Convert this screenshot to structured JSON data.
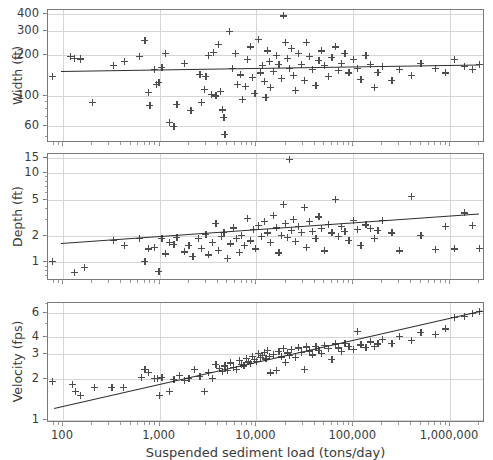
{
  "figure": {
    "xlabel": "Suspended sediment load (tons/day)",
    "background": "#ffffff",
    "marker_color": "#4d4d4d",
    "line_color": "#2e2e2e",
    "grid_color": "#d6d6d6"
  },
  "chart_data": [
    {
      "type": "scatter",
      "title": "",
      "panel": "width",
      "xlabel": "Suspended sediment load (tons/day)",
      "ylabel": "Width (ft)",
      "xscale": "log",
      "yscale": "log",
      "xlim": [
        70,
        2300000
      ],
      "ylim": [
        45,
        430
      ],
      "xticks": [
        100,
        1000,
        10000,
        100000,
        1000000
      ],
      "xtick_labels": [
        "100",
        "1,000",
        "10,000",
        "100,000",
        "1,000,000"
      ],
      "yticks": [
        60,
        100,
        200,
        300,
        400
      ],
      "ytick_labels": [
        "60",
        "100",
        "200",
        "300",
        "400"
      ],
      "grid": true,
      "legend": "none",
      "trendline": {
        "x": [
          95,
          2000000
        ],
        "y": [
          152,
          170
        ]
      },
      "points": [
        [
          78,
          140
        ],
        [
          120,
          196
        ],
        [
          132,
          190
        ],
        [
          150,
          187
        ],
        [
          152,
          188
        ],
        [
          200,
          90
        ],
        [
          330,
          167
        ],
        [
          430,
          181
        ],
        [
          620,
          195
        ],
        [
          700,
          258
        ],
        [
          760,
          106
        ],
        [
          790,
          85
        ],
        [
          880,
          156
        ],
        [
          920,
          121
        ],
        [
          980,
          126
        ],
        [
          1050,
          163
        ],
        [
          1150,
          207
        ],
        [
          1250,
          64
        ],
        [
          1400,
          60
        ],
        [
          1500,
          87
        ],
        [
          1800,
          175
        ],
        [
          2100,
          78
        ],
        [
          2600,
          145
        ],
        [
          2700,
          90
        ],
        [
          2900,
          112
        ],
        [
          3000,
          140
        ],
        [
          3200,
          199
        ],
        [
          3400,
          103
        ],
        [
          3600,
          211
        ],
        [
          3800,
          100
        ],
        [
          4000,
          240
        ],
        [
          4200,
          108
        ],
        [
          4400,
          79
        ],
        [
          4600,
          70
        ],
        [
          4700,
          52
        ],
        [
          5200,
          300
        ],
        [
          5600,
          160
        ],
        [
          6000,
          205
        ],
        [
          6400,
          122
        ],
        [
          6800,
          143
        ],
        [
          7200,
          95
        ],
        [
          7600,
          118
        ],
        [
          8000,
          186
        ],
        [
          8600,
          230
        ],
        [
          9000,
          137
        ],
        [
          9600,
          104
        ],
        [
          10500,
          260
        ],
        [
          11000,
          148
        ],
        [
          11500,
          167
        ],
        [
          12000,
          128
        ],
        [
          12500,
          98
        ],
        [
          13000,
          215
        ],
        [
          13500,
          180
        ],
        [
          14000,
          115
        ],
        [
          15000,
          152
        ],
        [
          16000,
          200
        ],
        [
          17000,
          170
        ],
        [
          18000,
          135
        ],
        [
          19000,
          390
        ],
        [
          20000,
          250
        ],
        [
          21000,
          190
        ],
        [
          22000,
          160
        ],
        [
          23000,
          225
        ],
        [
          24000,
          142
        ],
        [
          25000,
          110
        ],
        [
          27000,
          205
        ],
        [
          29000,
          172
        ],
        [
          31000,
          130
        ],
        [
          33000,
          248
        ],
        [
          35000,
          195
        ],
        [
          38000,
          158
        ],
        [
          41000,
          120
        ],
        [
          44000,
          182
        ],
        [
          47000,
          215
        ],
        [
          50000,
          168
        ],
        [
          55000,
          140
        ],
        [
          60000,
          192
        ],
        [
          65000,
          230
        ],
        [
          70000,
          155
        ],
        [
          75000,
          175
        ],
        [
          82000,
          205
        ],
        [
          90000,
          148
        ],
        [
          100000,
          185
        ],
        [
          110000,
          160
        ],
        [
          120000,
          132
        ],
        [
          135000,
          198
        ],
        [
          150000,
          172
        ],
        [
          165000,
          115
        ],
        [
          180000,
          150
        ],
        [
          200000,
          165
        ],
        [
          250000,
          130
        ],
        [
          300000,
          158
        ],
        [
          400000,
          142
        ],
        [
          500000,
          175
        ],
        [
          700000,
          160
        ],
        [
          900000,
          148
        ],
        [
          1100000,
          186
        ],
        [
          1400000,
          166
        ],
        [
          1700000,
          158
        ],
        [
          2000000,
          170
        ]
      ]
    },
    {
      "type": "scatter",
      "title": "",
      "panel": "depth",
      "xlabel": "Suspended sediment load (tons/day)",
      "ylabel": "Depth (ft)",
      "xscale": "log",
      "yscale": "log",
      "xlim": [
        70,
        2300000
      ],
      "ylim": [
        0.62,
        16.5
      ],
      "xticks": [
        100,
        1000,
        10000,
        100000,
        1000000
      ],
      "xtick_labels": [
        "100",
        "1,000",
        "10,000",
        "100,000",
        "1,000,000"
      ],
      "yticks": [
        1,
        2,
        5,
        10,
        15
      ],
      "ytick_labels": [
        "1",
        "2",
        "5",
        "10",
        "15"
      ],
      "grid": true,
      "legend": "none",
      "trendline": {
        "x": [
          95,
          2000000
        ],
        "y": [
          1.66,
          3.55
        ]
      },
      "points": [
        [
          78,
          1.02
        ],
        [
          130,
          0.78
        ],
        [
          165,
          0.88
        ],
        [
          330,
          1.78
        ],
        [
          430,
          1.55
        ],
        [
          620,
          1.86
        ],
        [
          700,
          1.02
        ],
        [
          760,
          1.42
        ],
        [
          880,
          1.48
        ],
        [
          980,
          0.79
        ],
        [
          1050,
          1.88
        ],
        [
          1150,
          1.25
        ],
        [
          1250,
          1.7
        ],
        [
          1400,
          1.6
        ],
        [
          1500,
          1.92
        ],
        [
          1800,
          1.32
        ],
        [
          2000,
          1.55
        ],
        [
          2200,
          1.18
        ],
        [
          2500,
          1.85
        ],
        [
          2700,
          1.45
        ],
        [
          3000,
          2.08
        ],
        [
          3200,
          1.22
        ],
        [
          3500,
          1.7
        ],
        [
          3800,
          2.75
        ],
        [
          4000,
          1.38
        ],
        [
          4300,
          1.95
        ],
        [
          4600,
          2.2
        ],
        [
          5000,
          1.12
        ],
        [
          5400,
          1.62
        ],
        [
          5800,
          2.45
        ],
        [
          6200,
          1.88
        ],
        [
          6600,
          1.3
        ],
        [
          7000,
          2.02
        ],
        [
          7500,
          1.55
        ],
        [
          8000,
          3.1
        ],
        [
          8600,
          1.75
        ],
        [
          9200,
          2.35
        ],
        [
          9800,
          1.42
        ],
        [
          10500,
          2.6
        ],
        [
          11200,
          1.95
        ],
        [
          12000,
          2.88
        ],
        [
          13000,
          2.15
        ],
        [
          14000,
          1.68
        ],
        [
          15000,
          3.4
        ],
        [
          16000,
          2.45
        ],
        [
          17000,
          1.28
        ],
        [
          18000,
          2.02
        ],
        [
          19000,
          4.5
        ],
        [
          20000,
          2.75
        ],
        [
          21000,
          1.92
        ],
        [
          22000,
          14.5
        ],
        [
          23000,
          2.3
        ],
        [
          24000,
          3.05
        ],
        [
          25000,
          1.72
        ],
        [
          27000,
          2.55
        ],
        [
          29000,
          2.18
        ],
        [
          31000,
          4.2
        ],
        [
          33000,
          1.48
        ],
        [
          35000,
          2.9
        ],
        [
          38000,
          2.25
        ],
        [
          41000,
          1.85
        ],
        [
          44000,
          3.25
        ],
        [
          47000,
          2.42
        ],
        [
          50000,
          1.35
        ],
        [
          55000,
          2.68
        ],
        [
          60000,
          2.15
        ],
        [
          65000,
          5.1
        ],
        [
          70000,
          1.95
        ],
        [
          75000,
          2.52
        ],
        [
          82000,
          2.22
        ],
        [
          90000,
          1.78
        ],
        [
          100000,
          2.95
        ],
        [
          110000,
          2.35
        ],
        [
          120000,
          1.55
        ],
        [
          135000,
          2.65
        ],
        [
          150000,
          2.42
        ],
        [
          165000,
          1.88
        ],
        [
          180000,
          2.28
        ],
        [
          200000,
          3.0
        ],
        [
          250000,
          2.15
        ],
        [
          300000,
          1.35
        ],
        [
          400000,
          5.5
        ],
        [
          500000,
          2.02
        ],
        [
          700000,
          1.4
        ],
        [
          900000,
          2.55
        ],
        [
          1100000,
          1.42
        ],
        [
          1400000,
          3.6
        ],
        [
          1700000,
          2.62
        ],
        [
          2000000,
          1.45
        ]
      ]
    },
    {
      "type": "scatter",
      "title": "",
      "panel": "velocity",
      "xlabel": "Suspended sediment load (tons/day)",
      "ylabel": "Velocity (fps)",
      "xscale": "log",
      "yscale": "log",
      "xlim": [
        70,
        2300000
      ],
      "ylim": [
        0.95,
        7.1
      ],
      "xticks": [
        100,
        1000,
        10000,
        100000,
        1000000
      ],
      "xtick_labels": [
        "100",
        "1,000",
        "10,000",
        "100,000",
        "1,000,000"
      ],
      "yticks": [
        1,
        2,
        3,
        4,
        6
      ],
      "ytick_labels": [
        "1",
        "2",
        "3",
        "4",
        "6"
      ],
      "grid": true,
      "legend": "none",
      "trendline": {
        "x": [
          80,
          2100000
        ],
        "y": [
          1.22,
          6.25
        ]
      },
      "points": [
        [
          78,
          1.92
        ],
        [
          125,
          1.82
        ],
        [
          135,
          1.62
        ],
        [
          150,
          1.52
        ],
        [
          210,
          1.72
        ],
        [
          320,
          1.72
        ],
        [
          420,
          1.72
        ],
        [
          640,
          2.04
        ],
        [
          700,
          2.32
        ],
        [
          760,
          2.22
        ],
        [
          880,
          2.02
        ],
        [
          950,
          2.02
        ],
        [
          1000,
          1.52
        ],
        [
          1050,
          2.04
        ],
        [
          1250,
          1.62
        ],
        [
          1400,
          1.98
        ],
        [
          1600,
          2.12
        ],
        [
          1800,
          1.95
        ],
        [
          2000,
          2.02
        ],
        [
          2300,
          2.35
        ],
        [
          2600,
          2.08
        ],
        [
          2900,
          1.62
        ],
        [
          3200,
          2.22
        ],
        [
          3500,
          2.02
        ],
        [
          3800,
          2.55
        ],
        [
          4100,
          2.38
        ],
        [
          4400,
          2.25
        ],
        [
          4700,
          2.48
        ],
        [
          5000,
          2.3
        ],
        [
          5400,
          2.6
        ],
        [
          5800,
          2.42
        ],
        [
          6200,
          2.35
        ],
        [
          6600,
          2.72
        ],
        [
          7000,
          2.55
        ],
        [
          7400,
          2.48
        ],
        [
          7800,
          2.82
        ],
        [
          8200,
          2.65
        ],
        [
          8600,
          2.58
        ],
        [
          9000,
          2.9
        ],
        [
          9500,
          2.75
        ],
        [
          10000,
          2.68
        ],
        [
          10500,
          3.05
        ],
        [
          11000,
          2.85
        ],
        [
          11500,
          2.95
        ],
        [
          12000,
          3.1
        ],
        [
          12500,
          2.78
        ],
        [
          13000,
          3.2
        ],
        [
          13500,
          2.92
        ],
        [
          14000,
          2.2
        ],
        [
          15000,
          3.0
        ],
        [
          16000,
          2.3
        ],
        [
          17000,
          3.15
        ],
        [
          18000,
          2.88
        ],
        [
          19000,
          3.3
        ],
        [
          20000,
          2.62
        ],
        [
          21000,
          3.08
        ],
        [
          22000,
          2.95
        ],
        [
          23000,
          3.25
        ],
        [
          25000,
          2.85
        ],
        [
          27000,
          3.35
        ],
        [
          29000,
          3.12
        ],
        [
          31000,
          2.35
        ],
        [
          33000,
          3.4
        ],
        [
          35000,
          3.18
        ],
        [
          38000,
          2.98
        ],
        [
          41000,
          3.45
        ],
        [
          44000,
          3.22
        ],
        [
          47000,
          3.05
        ],
        [
          50000,
          3.5
        ],
        [
          55000,
          3.3
        ],
        [
          60000,
          2.75
        ],
        [
          65000,
          3.58
        ],
        [
          70000,
          3.35
        ],
        [
          75000,
          3.15
        ],
        [
          82000,
          3.62
        ],
        [
          90000,
          3.42
        ],
        [
          100000,
          3.28
        ],
        [
          110000,
          4.4
        ],
        [
          120000,
          3.52
        ],
        [
          135000,
          3.38
        ],
        [
          150000,
          3.7
        ],
        [
          165000,
          3.45
        ],
        [
          180000,
          3.58
        ],
        [
          200000,
          3.85
        ],
        [
          250000,
          3.62
        ],
        [
          300000,
          4.05
        ],
        [
          400000,
          3.82
        ],
        [
          500000,
          4.35
        ],
        [
          700000,
          4.2
        ],
        [
          900000,
          4.6
        ],
        [
          1100000,
          5.6
        ],
        [
          1400000,
          5.65
        ],
        [
          1700000,
          5.95
        ],
        [
          2000000,
          6.2
        ]
      ]
    }
  ]
}
